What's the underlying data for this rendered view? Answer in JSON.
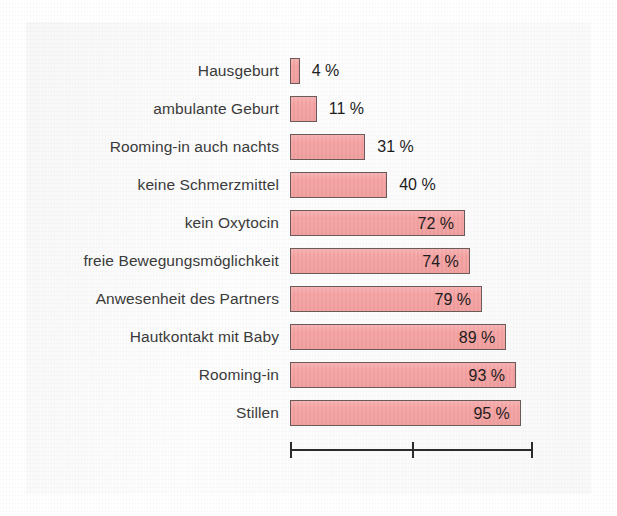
{
  "figure": {
    "kind": "horizontal-bar-chart",
    "background_color": "#ffffff",
    "bar_fill_color": "#f4a0a0",
    "bar_border_color": "#6b5b58",
    "text_color": "#3a3a3a",
    "value_text_color": "#1d1d1d",
    "axis_color": "#2b2b2b"
  },
  "chart_data": {
    "type": "bar",
    "orientation": "horizontal",
    "title": "",
    "subtitle": "",
    "xlabel": "",
    "ylabel": "",
    "xlim": [
      0,
      100
    ],
    "grid": false,
    "legend": null,
    "value_unit": "%",
    "value_label_format": "{v} %",
    "axis_ticks": [
      0,
      50,
      100
    ],
    "axis_tick_labels": [
      "",
      "",
      ""
    ],
    "categories": [
      "Hausgeburt",
      "ambulante Geburt",
      "Rooming-in auch nachts",
      "keine Schmerzmittel",
      "kein Oxytocin",
      "freie Bewegungsmöglichkeit",
      "Anwesenheit des Partners",
      "Hautkontakt mit Baby",
      "Rooming-in",
      "Stillen"
    ],
    "values": [
      4,
      11,
      31,
      40,
      72,
      74,
      79,
      89,
      93,
      95
    ],
    "value_labels": [
      "4 %",
      "11 %",
      "31 %",
      "40 %",
      "72 %",
      "74 %",
      "79 %",
      "89 %",
      "93 %",
      "95 %"
    ],
    "label_placement": [
      "outside",
      "outside",
      "outside",
      "outside",
      "inside",
      "inside",
      "inside",
      "inside",
      "inside",
      "inside"
    ]
  }
}
